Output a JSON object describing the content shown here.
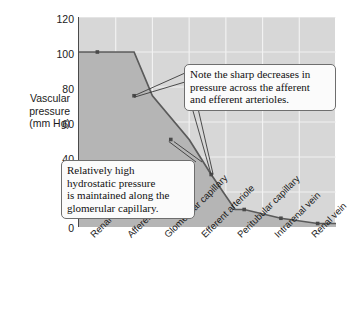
{
  "chart_data": {
    "type": "area",
    "title": "",
    "xlabel": "",
    "ylabel": "Vascular pressure (mm Hg)",
    "ylim": [
      0,
      120
    ],
    "yticks": [
      0,
      20,
      40,
      60,
      80,
      100,
      120
    ],
    "grid": true,
    "legend": "none",
    "categories": [
      "Renal artery",
      "Afferent arteriole",
      "Glomerular capillary",
      "Efferent arteriole",
      "Peritubular capillary",
      "Intrarenal vein",
      "Renal vein"
    ],
    "values": [
      100,
      75,
      50,
      30,
      10,
      5,
      2
    ],
    "series": [
      {
        "name": "Vascular pressure",
        "values": [
          100,
          75,
          50,
          30,
          10,
          5,
          2
        ]
      }
    ],
    "annotations": [
      {
        "id": "arterioles",
        "text": "Note the sharp decreases in pressure across the afferent and efferent arterioles.",
        "points_to": [
          "Afferent arteriole",
          "Efferent arteriole"
        ]
      },
      {
        "id": "glomerular",
        "text": "Relatively high hydrostatic pressure is maintained along the glomerular capillary.",
        "points_to": [
          "Glomerular capillary"
        ]
      }
    ]
  },
  "axis": {
    "y_title_lines": [
      "Vascular",
      "pressure",
      "(mm Hg)"
    ],
    "y_tick_labels": [
      "120",
      "100",
      "80",
      "60",
      "40",
      "20",
      "0"
    ]
  },
  "callouts": {
    "arterioles": {
      "lines": [
        "Note the sharp decreases in",
        "pressure across the afferent",
        "and efferent arterioles."
      ]
    },
    "glomerular": {
      "lines": [
        "Relatively high",
        "hydrostatic pressure",
        "is maintained along the",
        "glomerular capillary."
      ]
    }
  },
  "colors": {
    "plot_background": "#d7d7d7",
    "gridline": "#f2f2f2",
    "area_fill": "#b5b5b5",
    "data_line": "#5a5a5a",
    "axis_line": "#4a4a4a",
    "text": "#1b1b1b",
    "callout_background": "#fbfbfb",
    "callout_border": "#6e6e6e"
  }
}
